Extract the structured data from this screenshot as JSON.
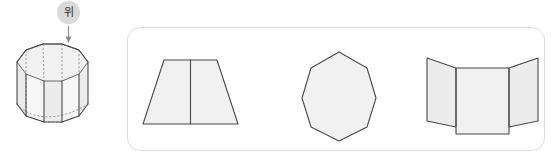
{
  "figure": {
    "background_color": "#ffffff"
  },
  "direction_marker": {
    "label": "위",
    "label_meaning": "top",
    "badge_color": "#d9d9d9",
    "badge_text_color": "#2e2e2e",
    "arrow_icon": "arrow-down-icon",
    "arrow_color": "#8a8a8a",
    "arrow_direction": "down"
  },
  "solid": {
    "name": "octagonal-prism",
    "sides": 8,
    "fill_color": "#f1f1f1",
    "edge_color": "#4a4a4a",
    "hidden_edge_color": "#8c8c8c",
    "hidden_edge_style": "dashed"
  },
  "options_panel": {
    "border_color": "#dcdcdc",
    "corner_radius": "13px",
    "options": [
      {
        "index": 1,
        "name": "trapezoid-with-center-line",
        "shape": "trapezoid",
        "divider": "vertical-center-line",
        "fill_color": "#f1f1f1",
        "edge_color": "#4a4a4a"
      },
      {
        "index": 2,
        "name": "regular-octagon",
        "shape": "octagon",
        "sides": 8,
        "fill_color": "#f1f1f1",
        "edge_color": "#4a4a4a"
      },
      {
        "index": 3,
        "name": "three-panel-folded-screen",
        "shape": "folded-panels",
        "panel_count": 3,
        "fill_color": "#f1f1f1",
        "edge_color": "#4a4a4a"
      }
    ]
  }
}
